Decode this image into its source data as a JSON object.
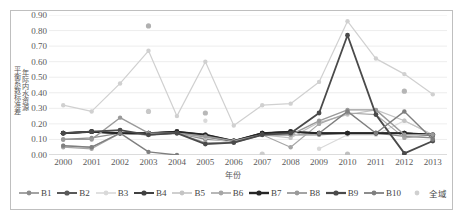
{
  "chart_data": {
    "type": "line",
    "title": "",
    "xlabel": "年份",
    "ylabel": "年际内水资源平衡系数标准差",
    "ylabel_lines": [
      "年际内水资源",
      "平衡系数标准差"
    ],
    "x": [
      "2000",
      "2001",
      "2002",
      "2003",
      "2004",
      "2005",
      "2006",
      "2007",
      "2008",
      "2009",
      "2010",
      "2011",
      "2012",
      "2013"
    ],
    "ylim": [
      0.0,
      0.9
    ],
    "yticks": [
      "0.00",
      "0.10",
      "0.20",
      "0.30",
      "0.40",
      "0.50",
      "0.60",
      "0.70",
      "0.80",
      "0.90"
    ],
    "ytick_values": [
      0.0,
      0.1,
      0.2,
      0.3,
      0.4,
      0.5,
      0.6,
      0.7,
      0.8,
      0.9
    ],
    "grid": "horizontal",
    "legend_position": "bottom",
    "markers": "circle",
    "series": [
      {
        "name": "B1",
        "color": "#8c8c8c",
        "width": 1.2,
        "values": [
          0.1,
          0.11,
          0.14,
          0.13,
          0.14,
          0.1,
          0.09,
          0.13,
          0.13,
          0.13,
          0.14,
          0.14,
          0.12,
          0.11
        ]
      },
      {
        "name": "B2",
        "color": "#595959",
        "width": 1.6,
        "values": [
          0.14,
          0.15,
          0.14,
          0.14,
          0.15,
          0.11,
          0.09,
          0.14,
          0.15,
          0.14,
          0.14,
          0.14,
          0.14,
          0.13
        ]
      },
      {
        "name": "B3",
        "color": "#d9d9d9",
        "width": 1.2,
        "values": [
          null,
          null,
          null,
          null,
          null,
          0.22,
          null,
          null,
          null,
          0.04,
          0.13,
          0.13,
          0.22,
          0.13
        ]
      },
      {
        "name": "B4",
        "color": "#404040",
        "width": 1.6,
        "values": [
          0.14,
          0.15,
          0.14,
          0.14,
          0.15,
          0.13,
          0.09,
          0.14,
          0.15,
          0.14,
          0.14,
          0.14,
          0.14,
          0.13
        ]
      },
      {
        "name": "B5",
        "color": "#c4c4c4",
        "width": 1.2,
        "values": [
          0.06,
          0.05,
          0.14,
          0.13,
          0.14,
          0.11,
          0.08,
          0.13,
          0.11,
          0.21,
          0.26,
          0.29,
          0.22,
          0.13
        ]
      },
      {
        "name": "B6",
        "color": "#a6a6a6",
        "width": 1.2,
        "values": [
          0.05,
          0.04,
          0.14,
          0.13,
          0.14,
          0.08,
          0.08,
          0.13,
          0.05,
          0.2,
          0.27,
          0.26,
          0.11,
          0.13
        ]
      },
      {
        "name": "B7",
        "color": "#262626",
        "width": 2.0,
        "values": [
          0.14,
          0.15,
          0.14,
          0.14,
          0.15,
          0.13,
          0.09,
          0.14,
          0.15,
          0.14,
          0.14,
          0.14,
          0.14,
          0.13
        ]
      },
      {
        "name": "B8",
        "color": "#9a9a9a",
        "width": 1.4,
        "values": [
          0.1,
          0.1,
          0.24,
          0.14,
          0.14,
          0.12,
          0.09,
          0.13,
          0.13,
          0.22,
          0.29,
          0.29,
          0.13,
          0.13
        ]
      },
      {
        "name": "B9",
        "color": "#4a4a4a",
        "width": 1.8,
        "values": [
          0.14,
          0.15,
          0.16,
          0.13,
          0.14,
          0.07,
          0.08,
          0.13,
          0.14,
          0.27,
          0.77,
          0.26,
          0.01,
          0.09
        ]
      },
      {
        "name": "B10",
        "color": "#7f7f7f",
        "width": 1.4,
        "values": [
          0.06,
          0.05,
          0.14,
          0.02,
          0.0,
          null,
          null,
          null,
          null,
          0.14,
          0.28,
          0.14,
          0.28,
          0.1
        ]
      },
      {
        "name": "全域",
        "color": "#d0d0d0",
        "width": 1.2,
        "values": [
          0.32,
          0.28,
          0.46,
          0.67,
          0.25,
          0.6,
          0.19,
          0.32,
          0.33,
          0.47,
          0.86,
          0.62,
          0.52,
          0.39
        ]
      }
    ],
    "extra_points": [
      {
        "series": "全域-outlier",
        "x": "2003",
        "y": 0.83,
        "color": "#b0b0b0"
      },
      {
        "series": "全域-low",
        "x": "2003",
        "y": 0.28,
        "color": "#c8c8c8"
      },
      {
        "series": "全域-low",
        "x": "2005",
        "y": 0.27,
        "color": "#b8b8b8"
      },
      {
        "series": "全域-low",
        "x": "2007",
        "y": 0.005,
        "color": "#cccccc"
      },
      {
        "series": "全域-low",
        "x": "2010",
        "y": 0.005,
        "color": "#c0c0c0"
      },
      {
        "series": "全域-low",
        "x": "2012",
        "y": 0.41,
        "color": "#b5b5b5"
      }
    ]
  },
  "legend": {
    "items": [
      {
        "label": "B1",
        "color": "#8c8c8c",
        "width": 1.2
      },
      {
        "label": "B2",
        "color": "#595959",
        "width": 1.6
      },
      {
        "label": "B3",
        "color": "#d9d9d9",
        "width": 1.2
      },
      {
        "label": "B4",
        "color": "#404040",
        "width": 1.6
      },
      {
        "label": "B5",
        "color": "#c4c4c4",
        "width": 1.2
      },
      {
        "label": "B6",
        "color": "#a6a6a6",
        "width": 1.2
      },
      {
        "label": "B7",
        "color": "#262626",
        "width": 2.0
      },
      {
        "label": "B8",
        "color": "#9a9a9a",
        "width": 1.4
      },
      {
        "label": "B9",
        "color": "#4a4a4a",
        "width": 1.8
      },
      {
        "label": "B10",
        "color": "#7f7f7f",
        "width": 1.4
      },
      {
        "label": "全域",
        "color": "#d0d0d0",
        "width": 0
      }
    ]
  },
  "style": {
    "frame_color": "#bfbfbf",
    "grid_color": "#e8e8e8",
    "axis_color": "#b0b0b0",
    "text_color": "#5a5a5a",
    "background": "#ffffff"
  }
}
